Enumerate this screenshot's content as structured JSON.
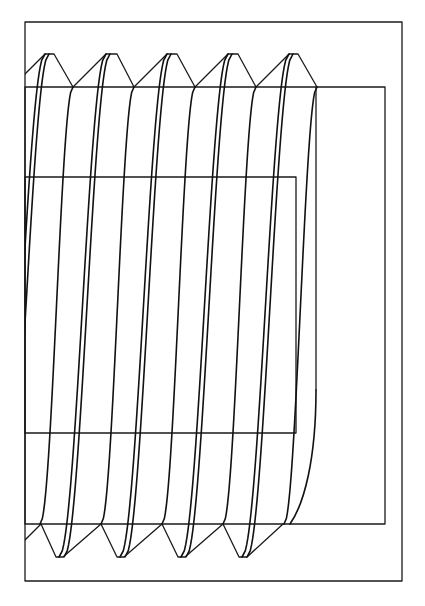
{
  "drawing": {
    "subject": "threaded screw side view (helical thread projection)",
    "canvas": {
      "width": 425,
      "height": 606,
      "background": "#ffffff",
      "line_color": "#1a1a1a"
    },
    "rectangles": [
      {
        "name": "outer-frame",
        "x1": 25,
        "y1": 22,
        "x2": 402,
        "y2": 581
      },
      {
        "name": "major-diameter-body",
        "x1": 25,
        "y1": 87,
        "x2": 385,
        "y2": 524
      },
      {
        "name": "minor-core",
        "x1": 25,
        "y1": 177,
        "x2": 296,
        "y2": 433
      }
    ],
    "thread": {
      "pitch": 61,
      "crest_top_y": 54,
      "root_top_y": 87,
      "root_bottom_y": 524,
      "crest_bottom_y": 557,
      "top_roots_x": [
        12,
        73,
        134,
        195,
        256
      ],
      "top_crests": [
        [
          45,
          54
        ],
        [
          106,
          117
        ],
        [
          167,
          177
        ],
        [
          228,
          238
        ],
        [
          289,
          298
        ]
      ],
      "bottom_roots_x": [
        41,
        101,
        162,
        223,
        283
      ],
      "bottom_crests": [
        [
          56,
          63
        ],
        [
          117,
          124
        ],
        [
          178,
          185
        ],
        [
          239,
          247
        ]
      ],
      "end_root_x": 317,
      "left_clip_x": 25
    },
    "helix_curves_per_thread": [
      {
        "name": "crest-left-helix",
        "top": [
          33,
          54
        ],
        "mid_top": [
          17,
          87
        ],
        "mid_bottom": [
          -6,
          524
        ],
        "bottom": [
          -14,
          557
        ]
      },
      {
        "name": "crest-right-helix",
        "top": [
          37,
          54
        ],
        "mid_top": [
          27,
          87
        ],
        "mid_bottom": [
          6,
          524
        ],
        "bottom": [
          -9,
          557
        ]
      },
      {
        "name": "root-helix",
        "top": [
          61,
          87
        ],
        "bottom": [
          28,
          524
        ]
      }
    ],
    "end_cap": {
      "vertical_x": 316,
      "vertical_top_y": 87,
      "vertical_bottom_y": 390,
      "curve_end": [
        290,
        524
      ]
    }
  }
}
